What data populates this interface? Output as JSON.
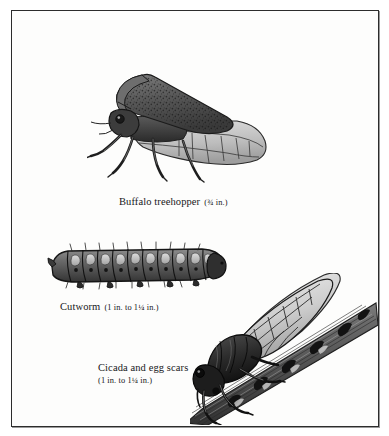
{
  "plate": {
    "background_color": "#fdfdfc",
    "border_color": "#2c2c2c",
    "ink_color": "#17171a"
  },
  "figures": [
    {
      "id": "buffalo-treehopper",
      "icon": "buffalo-treehopper-illustration",
      "caption_name": "Buffalo treehopper",
      "caption_size": "(¾ in.)"
    },
    {
      "id": "cutworm",
      "icon": "cutworm-caterpillar-illustration",
      "caption_name": "Cutworm",
      "caption_size": "(1 in. to 1¼ in.)"
    },
    {
      "id": "cicada",
      "icon": "cicada-on-branch-illustration",
      "caption_name": "Cicada and egg scars",
      "caption_size": "(1 in. to 1¼ in.)"
    }
  ]
}
